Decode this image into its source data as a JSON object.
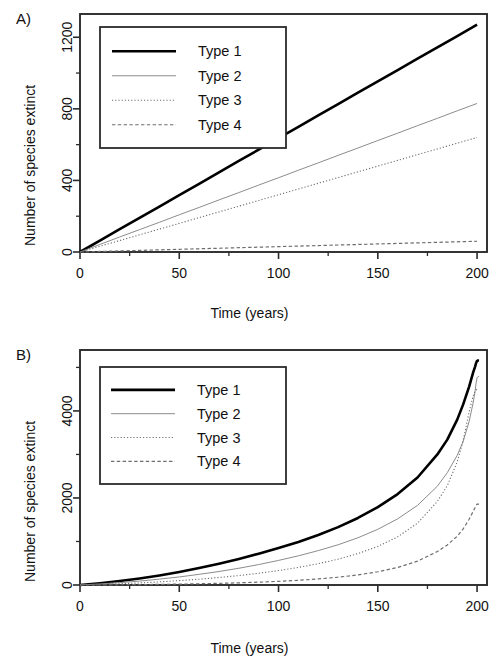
{
  "figure": {
    "background": "#ffffff",
    "panels": [
      {
        "letter": "A)",
        "xlabel": "Time (years)",
        "ylabel": "Number of species extinct"
      },
      {
        "letter": "B)",
        "xlabel": "Time (years)",
        "ylabel": "Number of species extinct"
      }
    ]
  },
  "style": {
    "type1_color": "#000000",
    "type2_color": "#8c8c8c",
    "type3_color": "#6e6e6e",
    "type4_color": "#6e6e6e",
    "axis_color": "#2b2b2b",
    "text_color": "#111111"
  },
  "legend": {
    "entries": [
      {
        "label": "Type 1",
        "dash": "solid",
        "width": 2.6,
        "color": "#000000"
      },
      {
        "label": "Type 2",
        "dash": "solid",
        "width": 1.0,
        "color": "#8c8c8c"
      },
      {
        "label": "Type 3",
        "dash": "dotted",
        "width": 1.1,
        "color": "#6e6e6e"
      },
      {
        "label": "Type 4",
        "dash": "dashed",
        "width": 1.2,
        "color": "#6e6e6e"
      }
    ]
  },
  "chart_data": [
    {
      "type": "line",
      "panel": "A)",
      "title": "",
      "xlabel": "Time (years)",
      "ylabel": "Number of species extinct",
      "xlim": [
        0,
        205
      ],
      "ylim": [
        0,
        1330
      ],
      "grid": false,
      "legend_position": "top-left",
      "xticks": [
        0,
        50,
        100,
        150,
        200
      ],
      "xticklabels": [
        "0",
        "50",
        "100",
        "150",
        "200"
      ],
      "xminorticks": [
        25,
        75,
        125,
        175
      ],
      "yticks": [
        0,
        400,
        800,
        1200
      ],
      "yticklabels": [
        "0",
        "400",
        "800",
        "1200"
      ],
      "yminorticks": [
        200,
        600,
        1000
      ],
      "x": [
        0,
        10,
        20,
        30,
        40,
        50,
        60,
        70,
        80,
        90,
        100,
        110,
        120,
        130,
        140,
        150,
        160,
        170,
        180,
        190,
        200
      ],
      "series": [
        {
          "name": "Type 1",
          "values": [
            0,
            64,
            128,
            191,
            254,
            318,
            381,
            445,
            509,
            572,
            636,
            699,
            763,
            826,
            890,
            953,
            1017,
            1080,
            1144,
            1207,
            1270
          ]
        },
        {
          "name": "Type 2",
          "values": [
            0,
            42,
            84,
            125,
            166,
            208,
            249,
            291,
            332,
            374,
            415,
            457,
            498,
            540,
            581,
            623,
            664,
            706,
            747,
            789,
            830
          ]
        },
        {
          "name": "Type 3",
          "values": [
            0,
            32,
            64,
            96,
            128,
            160,
            192,
            224,
            256,
            288,
            320,
            352,
            384,
            416,
            448,
            480,
            512,
            544,
            576,
            608,
            640
          ]
        },
        {
          "name": "Type 4",
          "values": [
            0,
            3,
            6,
            9,
            12,
            15,
            18,
            21,
            24,
            27,
            30,
            33,
            36,
            39,
            42,
            45,
            48,
            51,
            54,
            57,
            60
          ]
        }
      ]
    },
    {
      "type": "line",
      "panel": "B)",
      "title": "",
      "xlabel": "Time (years)",
      "ylabel": "Number of species extinct",
      "xlim": [
        0,
        205
      ],
      "ylim": [
        0,
        5400
      ],
      "grid": false,
      "legend_position": "top-left",
      "xticks": [
        0,
        50,
        100,
        150,
        200
      ],
      "xticklabels": [
        "0",
        "50",
        "100",
        "150",
        "200"
      ],
      "xminorticks": [
        25,
        75,
        125,
        175
      ],
      "yticks": [
        0,
        2000,
        4000
      ],
      "yticklabels": [
        "0",
        "2000",
        "4000"
      ],
      "yminorticks": [
        1000,
        3000,
        5000
      ],
      "x": [
        0,
        10,
        20,
        30,
        40,
        50,
        60,
        70,
        80,
        90,
        100,
        110,
        120,
        130,
        140,
        150,
        160,
        170,
        180,
        185,
        190,
        193,
        196,
        198,
        199,
        199.5,
        200,
        200.5,
        201
      ],
      "series": [
        {
          "name": "Type 1",
          "values": [
            0,
            40,
            90,
            150,
            220,
            300,
            390,
            490,
            600,
            720,
            850,
            990,
            1150,
            1330,
            1540,
            1790,
            2090,
            2470,
            3000,
            3340,
            3800,
            4150,
            4560,
            4880,
            5020,
            5100,
            5150,
            5160,
            5160
          ]
        },
        {
          "name": "Type 2",
          "values": [
            0,
            25,
            55,
            90,
            135,
            185,
            245,
            310,
            385,
            470,
            565,
            670,
            790,
            925,
            1085,
            1280,
            1520,
            1830,
            2270,
            2580,
            2980,
            3300,
            3760,
            4180,
            4450,
            4640,
            4760,
            4790,
            4790
          ]
        },
        {
          "name": "Type 3",
          "values": [
            0,
            12,
            28,
            48,
            72,
            100,
            133,
            172,
            217,
            270,
            332,
            404,
            490,
            594,
            722,
            886,
            1106,
            1420,
            1920,
            2280,
            2830,
            3320,
            3980,
            4340,
            4450,
            4480,
            4490,
            4490,
            4490
          ]
        },
        {
          "name": "Type 4",
          "values": [
            0,
            2,
            5,
            9,
            14,
            20,
            28,
            38,
            50,
            65,
            84,
            108,
            139,
            179,
            232,
            304,
            404,
            548,
            770,
            920,
            1120,
            1290,
            1510,
            1690,
            1780,
            1830,
            1860,
            1860,
            1860
          ]
        }
      ]
    }
  ]
}
